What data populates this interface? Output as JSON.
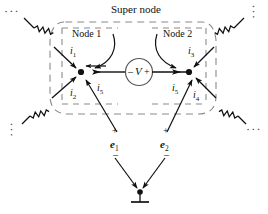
{
  "figure": {
    "type": "circuit-diagram",
    "title": "Super node",
    "background": "#ffffff",
    "ink_color": "#111111",
    "dash_color": "#8a8a8a"
  },
  "regions": {
    "supernode_label": "Super node",
    "node1_label": "Node 1",
    "node2_label": "Node 2"
  },
  "currents": {
    "i1": {
      "symbol": "i",
      "sub": "1"
    },
    "i2": {
      "symbol": "i",
      "sub": "2"
    },
    "i3": {
      "symbol": "i",
      "sub": "3"
    },
    "i4": {
      "symbol": "i",
      "sub": "4"
    },
    "i5_left": {
      "symbol": "i",
      "sub": "5"
    },
    "i5_right": {
      "symbol": "i",
      "sub": "5"
    }
  },
  "source": {
    "symbol": "V",
    "minus": "–",
    "plus": "+"
  },
  "node_voltages": {
    "e1": {
      "symbol": "e",
      "sub": "1",
      "plus": "+",
      "minus": "–"
    },
    "e2": {
      "symbol": "e",
      "sub": "2",
      "plus": "+",
      "minus": "–"
    }
  },
  "continuation": {
    "top_left": "⋰",
    "bottom_left": "⋰",
    "top_right": "⋰",
    "bottom_right": "⋰"
  },
  "components": {
    "resistor_count": 4,
    "resistor_labels": [
      "",
      "",
      "",
      ""
    ],
    "ground_symbol": "earth-ground"
  }
}
